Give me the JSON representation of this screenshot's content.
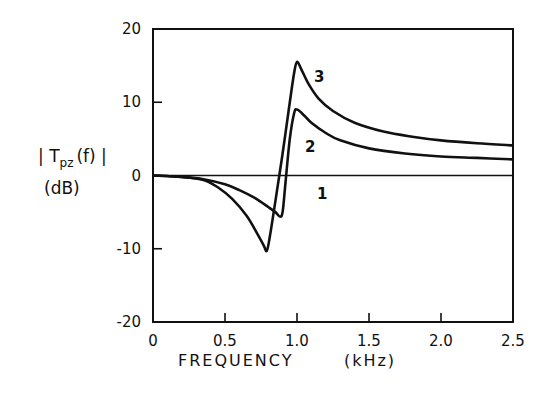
{
  "chart_data": {
    "type": "line",
    "title": "",
    "xlabel": "FREQUENCY (kHz)",
    "ylabel": "|Tpz(f)| (dB)",
    "xlim": [
      0,
      2.5
    ],
    "ylim": [
      -20,
      20
    ],
    "x_ticks": [
      0,
      0.5,
      1.0,
      1.5,
      2.0,
      2.5
    ],
    "x_tick_labels": [
      "0",
      "0.5",
      "1.0",
      "1.5",
      "2.0",
      "2.5"
    ],
    "y_ticks": [
      -20,
      -10,
      0,
      10,
      20
    ],
    "y_tick_labels": [
      "-20",
      "-10",
      "0",
      "10",
      "20"
    ],
    "grid": false,
    "legend": "inline curve labels",
    "series": [
      {
        "name": "1",
        "x": [
          0,
          2.5
        ],
        "y": [
          0,
          0
        ]
      },
      {
        "name": "2",
        "x": [
          0,
          0.2,
          0.35,
          0.5,
          0.6,
          0.7,
          0.8,
          0.85,
          0.88,
          0.9,
          0.92,
          0.95,
          0.98,
          1.0,
          1.05,
          1.1,
          1.2,
          1.3,
          1.5,
          1.75,
          2.0,
          2.25,
          2.5
        ],
        "y": [
          0,
          -0.2,
          -0.5,
          -1.2,
          -2.0,
          -3.0,
          -4.3,
          -5.0,
          -5.6,
          -5.0,
          -1.0,
          5.0,
          8.5,
          9.0,
          8.2,
          7.2,
          5.8,
          4.8,
          3.7,
          3.0,
          2.6,
          2.4,
          2.2
        ]
      },
      {
        "name": "3",
        "x": [
          0,
          0.2,
          0.35,
          0.45,
          0.55,
          0.65,
          0.72,
          0.77,
          0.79,
          0.81,
          0.85,
          0.9,
          0.95,
          0.98,
          1.0,
          1.03,
          1.08,
          1.15,
          1.25,
          1.4,
          1.6,
          1.8,
          2.0,
          2.25,
          2.5
        ],
        "y": [
          0,
          -0.2,
          -0.6,
          -1.6,
          -3.2,
          -5.5,
          -7.8,
          -9.6,
          -10.3,
          -8.5,
          -3.5,
          3.0,
          10.0,
          14.0,
          15.5,
          14.5,
          12.5,
          10.5,
          8.8,
          7.2,
          6.0,
          5.3,
          4.8,
          4.4,
          4.1
        ]
      }
    ]
  },
  "labels": {
    "ylabel_line1": "| T",
    "ylabel_sub": "pz",
    "ylabel_rest": "(f) |",
    "ylabel_line2": "(dB)",
    "xlabel_main": "FREQUENCY",
    "xlabel_unit": "(kHz)",
    "curve1": "1",
    "curve2": "2",
    "curve3": "3"
  }
}
